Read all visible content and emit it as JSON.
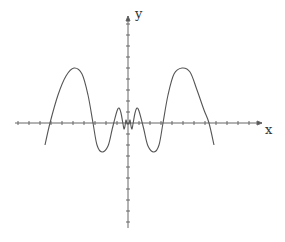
{
  "chart_data": {
    "type": "line",
    "title": "",
    "xlabel": "x",
    "ylabel": "y",
    "grid": false,
    "legend": null,
    "axes": {
      "origin_px": [
        128,
        123
      ],
      "x_axis_px": [
        15,
        262
      ],
      "y_axis_px": [
        16,
        228
      ],
      "tick_spacing_px": 11
    },
    "series": [
      {
        "name": "f(x)",
        "color": "#555555",
        "points_px": [
          [
            45,
            145
          ],
          [
            50,
            123
          ],
          [
            58,
            95
          ],
          [
            66,
            76
          ],
          [
            74,
            68
          ],
          [
            82,
            74
          ],
          [
            88,
            95
          ],
          [
            93,
            123
          ],
          [
            97,
            145
          ],
          [
            102,
            152
          ],
          [
            108,
            146
          ],
          [
            112,
            130
          ],
          [
            114,
            122
          ],
          [
            117,
            111
          ],
          [
            119,
            108
          ],
          [
            121,
            113
          ],
          [
            123,
            124
          ],
          [
            124,
            129
          ],
          [
            125,
            126
          ],
          [
            126,
            120
          ],
          [
            127,
            124
          ],
          [
            128,
            123
          ],
          [
            129,
            124
          ],
          [
            130,
            120
          ],
          [
            131,
            126
          ],
          [
            132,
            129
          ],
          [
            133,
            124
          ],
          [
            135,
            113
          ],
          [
            137,
            108
          ],
          [
            139,
            111
          ],
          [
            142,
            122
          ],
          [
            144,
            130
          ],
          [
            148,
            146
          ],
          [
            154,
            152
          ],
          [
            159,
            145
          ],
          [
            163,
            123
          ],
          [
            168,
            95
          ],
          [
            174,
            74
          ],
          [
            182,
            68
          ],
          [
            190,
            72
          ],
          [
            197,
            90
          ],
          [
            204,
            110
          ],
          [
            209,
            123
          ],
          [
            214,
            145
          ]
        ]
      }
    ]
  }
}
